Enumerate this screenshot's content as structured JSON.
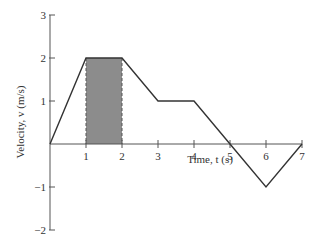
{
  "chart_data": {
    "type": "line",
    "title": "",
    "xlabel": "Time, t (s)",
    "ylabel": "Velocity, v (m/s)",
    "x": [
      0,
      1,
      2,
      3,
      4,
      5,
      6,
      7
    ],
    "series": [
      {
        "name": "velocity",
        "values": [
          0,
          2,
          2,
          1,
          1,
          0,
          -1,
          0
        ]
      }
    ],
    "x_ticks": [
      "1",
      "2",
      "3",
      "4",
      "5",
      "6",
      "7"
    ],
    "y_ticks": [
      "3",
      "2",
      "1",
      "-1",
      "-2"
    ],
    "xlim": [
      0,
      7
    ],
    "ylim": [
      -2,
      3
    ],
    "grid": false,
    "legend": "none",
    "annotations": [
      {
        "type": "shaded-region",
        "x_from": 1,
        "x_to": 2,
        "y_from": 0,
        "y_to": 2,
        "fill": "#8c8c8c",
        "border": "dashed"
      }
    ]
  },
  "colors": {
    "line": "#333333",
    "shade": "#8c8c8c",
    "axis": "#555555"
  }
}
